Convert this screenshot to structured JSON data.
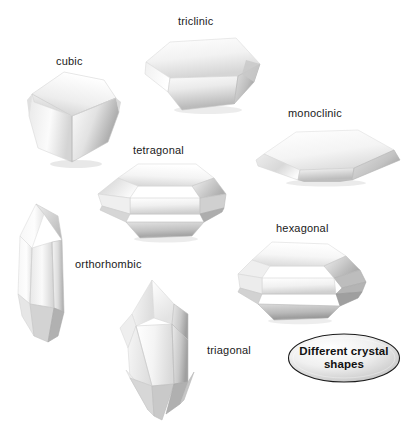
{
  "figure": {
    "title": "Different crystal shapes",
    "background_color": "#ffffff",
    "label_color": "#1a1a1a",
    "badge": {
      "line1": "Different crystal",
      "line2": "shapes",
      "fill_light": "#ffffff",
      "fill_dark": "#b9b9b9",
      "outline_color": "#1c1c1c"
    },
    "crystals": [
      {
        "id": "cubic",
        "label": "cubic",
        "label_x": 56,
        "label_y": 55,
        "description": "cube with bevelled corners, three visible faces"
      },
      {
        "id": "triclinic",
        "label": "triclinic",
        "label_x": 178,
        "label_y": 15,
        "description": "squat hexagonal tabular block, obliquely tilted"
      },
      {
        "id": "monoclinic",
        "label": "monoclinic",
        "label_x": 288,
        "label_y": 107,
        "description": "flat tabular crystal with slanted end faces"
      },
      {
        "id": "tetragonal",
        "label": "tetragonal",
        "label_x": 133,
        "label_y": 144,
        "description": "elongated prism with pyramidal terminations"
      },
      {
        "id": "orthorhombic",
        "label": "orthorhombic",
        "label_x": 75,
        "label_y": 258,
        "description": "tall vertical prism with pointed ends"
      },
      {
        "id": "hexagonal",
        "label": "hexagonal",
        "label_x": 276,
        "label_y": 222,
        "description": "six-sided prism lying on its side"
      },
      {
        "id": "triagonal",
        "label": "triagonal",
        "label_x": 207,
        "label_y": 344,
        "description": "three-sided prism with doubly terminated points"
      }
    ]
  }
}
